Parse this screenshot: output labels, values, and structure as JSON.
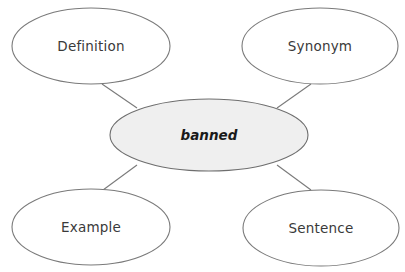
{
  "diagram": {
    "type": "word-map",
    "center": {
      "label": "banned",
      "cx": 209,
      "cy": 135,
      "rx": 99,
      "ry": 36,
      "fill": "#efefef"
    },
    "nodes": [
      {
        "id": "definition",
        "label": "Definition",
        "cx": 91,
        "cy": 46,
        "rx": 79,
        "ry": 38
      },
      {
        "id": "synonym",
        "label": "Synonym",
        "cx": 320,
        "cy": 46,
        "rx": 78,
        "ry": 38
      },
      {
        "id": "example",
        "label": "Example",
        "cx": 91,
        "cy": 227,
        "rx": 79,
        "ry": 38
      },
      {
        "id": "sentence",
        "label": "Sentence",
        "cx": 321,
        "cy": 228,
        "rx": 78,
        "ry": 38
      }
    ],
    "connectors": [
      {
        "from": "definition",
        "to": "center",
        "x1": 102,
        "y1": 84,
        "x2": 137,
        "y2": 108
      },
      {
        "from": "synonym",
        "to": "center",
        "x1": 311,
        "y1": 84,
        "x2": 277,
        "y2": 108
      },
      {
        "from": "example",
        "to": "center",
        "x1": 103,
        "y1": 190,
        "x2": 137,
        "y2": 165
      },
      {
        "from": "sentence",
        "to": "center",
        "x1": 311,
        "y1": 190,
        "x2": 277,
        "y2": 165
      }
    ],
    "colors": {
      "stroke": "#7a7a7a",
      "background": "#ffffff",
      "center_fill": "#efefef",
      "text": "#3a3a3a"
    }
  }
}
